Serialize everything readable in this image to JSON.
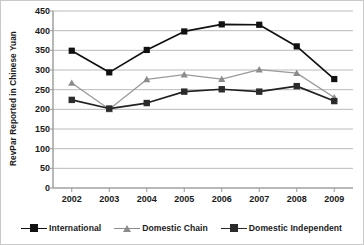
{
  "chart_data": {
    "type": "line",
    "title": "",
    "xlabel": "",
    "ylabel": "RevPar Reported in Chinese Yuan",
    "categories": [
      "2002",
      "2003",
      "2004",
      "2005",
      "2006",
      "2007",
      "2008",
      "2009"
    ],
    "x": [
      2002,
      2003,
      2004,
      2005,
      2006,
      2007,
      2008,
      2009
    ],
    "ylim": [
      0,
      450
    ],
    "yticks": [
      0,
      50,
      100,
      150,
      200,
      250,
      300,
      350,
      400,
      450
    ],
    "ytick_labels": [
      "0",
      "50",
      "100",
      "150",
      "200",
      "250",
      "300",
      "350",
      "400",
      "450"
    ],
    "grid": "horizontal",
    "legend_position": "bottom",
    "series": [
      {
        "name": "International",
        "marker": "square",
        "color": "#111111",
        "line_color": "#111111",
        "values": [
          349,
          294,
          351,
          398,
          416,
          415,
          360,
          277
        ]
      },
      {
        "name": "Domestic Chain",
        "marker": "triangle",
        "color": "#8c8c8c",
        "line_color": "#9a9a9a",
        "values": [
          267,
          200,
          276,
          288,
          277,
          301,
          292,
          230
        ]
      },
      {
        "name": "Domestic Independent",
        "marker": "square",
        "color": "#2b2b2b",
        "line_color": "#222222",
        "values": [
          224,
          202,
          216,
          245,
          251,
          245,
          259,
          221
        ]
      }
    ]
  },
  "axes": {
    "ylabel": "RevPar Reported in Chinese Yuan",
    "ytick_labels": [
      "450",
      "400",
      "350",
      "300",
      "250",
      "200",
      "150",
      "100",
      "50",
      "0"
    ],
    "xtick_labels": [
      "2002",
      "2003",
      "2004",
      "2005",
      "2006",
      "2007",
      "2008",
      "2009"
    ]
  },
  "legend": {
    "items": [
      {
        "label": "International",
        "color": "#111111",
        "marker": "square"
      },
      {
        "label": "Domestic Chain",
        "color": "#8c8c8c",
        "marker": "triangle"
      },
      {
        "label": "Domestic Independent",
        "color": "#2b2b2b",
        "marker": "square"
      }
    ]
  },
  "colors": {
    "gridline": "#b3b3b3",
    "axis": "#888888",
    "text": "#1a1a1a",
    "background": "#ffffff"
  }
}
